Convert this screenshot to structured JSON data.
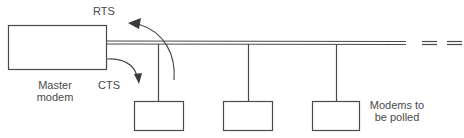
{
  "diagram": {
    "type": "multipoint polling line",
    "colors": {
      "stroke": "#4a4a4a",
      "background": "#ffffff"
    },
    "nodes": {
      "master": {
        "label_line1": "Master",
        "label_line2": "modem"
      },
      "slaves": [
        {
          "id": "slave-1"
        },
        {
          "id": "slave-2"
        },
        {
          "id": "slave-3"
        }
      ],
      "slaves_label_line1": "Modems to",
      "slaves_label_line2": "be polled"
    },
    "signals": {
      "rts": "RTS",
      "cts": "CTS"
    },
    "continuation": "= ="
  }
}
